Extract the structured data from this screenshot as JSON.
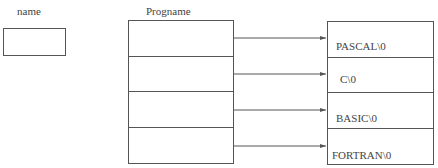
{
  "name_label": "name",
  "array_label": "Progname",
  "strings": [
    "PASCAL\\0",
    "C\\0",
    "BASIC\\0",
    "FORTRAN\\0"
  ],
  "colors": {
    "line": "#555555",
    "text": "#444444"
  }
}
